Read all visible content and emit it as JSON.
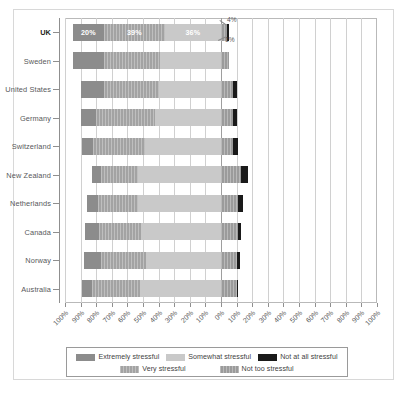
{
  "chart_data": {
    "type": "bar",
    "subtype": "diverging-stacked-bar",
    "title": "",
    "xlabel": "",
    "ylabel": "",
    "grid": true,
    "legend_position": "bottom",
    "axis": {
      "tick_labels": [
        "100%",
        "90%",
        "80%",
        "70%",
        "60%",
        "50%",
        "40%",
        "30%",
        "20%",
        "10%",
        "0%",
        "10%",
        "20%",
        "30%",
        "40%",
        "50%",
        "60%",
        "70%",
        "80%",
        "90%",
        "100%"
      ],
      "tick_values": [
        -100,
        -90,
        -80,
        -70,
        -60,
        -50,
        -40,
        -30,
        -20,
        -10,
        0,
        10,
        20,
        30,
        40,
        50,
        60,
        70,
        80,
        90,
        100
      ],
      "xlim": [
        -100,
        100
      ],
      "diverging_origin": 0
    },
    "categories": [
      "UK",
      "Sweden",
      "United States",
      "Germany",
      "Switzerland",
      "New Zealand",
      "Netherlands",
      "Canada",
      "Norway",
      "Australia"
    ],
    "highlighted_category": "UK",
    "series": [
      {
        "name": "Extremely stressful",
        "color": "#8c8c8c",
        "pattern": "solid",
        "values": [
          20,
          20,
          15,
          10,
          7,
          6,
          7,
          9,
          11,
          6
        ]
      },
      {
        "name": "Very stressful",
        "color": "#a3a3a3",
        "pattern": "hatched",
        "values": [
          39,
          36,
          35,
          38,
          33,
          24,
          26,
          27,
          29,
          31
        ]
      },
      {
        "name": "Somewhat stressful",
        "color": "#c9c9c9",
        "pattern": "solid",
        "values": [
          36,
          39,
          40,
          42,
          49,
          53,
          53,
          51,
          48,
          52
        ]
      },
      {
        "name": "Not too stressful",
        "color": "#9b9b9b",
        "pattern": "hatched",
        "values": [
          4,
          5,
          8,
          8,
          8,
          13,
          11,
          11,
          10,
          10
        ]
      },
      {
        "name": "Not at all stressful",
        "color": "#1a1a1a",
        "pattern": "solid",
        "values": [
          1,
          0,
          2,
          2,
          3,
          4,
          3,
          2,
          2,
          1
        ]
      }
    ],
    "annotations": [
      {
        "text": "4%",
        "category": "UK",
        "series": "Not too stressful"
      },
      {
        "text": "1%",
        "category": "UK",
        "series": "Not at all stressful"
      }
    ],
    "value_labels": {
      "UK": [
        "20%",
        "39%",
        "36%"
      ]
    }
  },
  "legend": {
    "row1": [
      {
        "label": "Extremely stressful",
        "color": "#8c8c8c",
        "pattern": "solid"
      },
      {
        "label": "Somewhat stressful",
        "color": "#c9c9c9",
        "pattern": "solid"
      },
      {
        "label": "Not at all stressful",
        "color": "#1a1a1a",
        "pattern": "solid"
      }
    ],
    "row2": [
      {
        "label": "Very stressful",
        "color": "#a3a3a3",
        "pattern": "hatched"
      },
      {
        "label": "Not too stressful",
        "color": "#9b9b9b",
        "pattern": "hatched"
      }
    ]
  },
  "caption": ""
}
